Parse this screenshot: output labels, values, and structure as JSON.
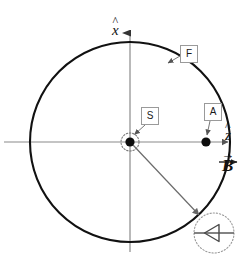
{
  "figure": {
    "type": "vector-diagram",
    "background_color": "#ffffff",
    "stroke_color": "#111111",
    "thin_stroke_color": "#888888",
    "dotted_stroke_color": "#9a9a9a",
    "box_border_color": "#9a9a9a",
    "width": 249,
    "height": 264
  },
  "axes": {
    "vertical": {
      "name": "x-axis",
      "label": "x",
      "accent": "hat",
      "accent_glyph": "^",
      "x": 130,
      "y_top": 30,
      "y_bottom": 252,
      "arrow_at": "top"
    },
    "horizontal": {
      "name": "z-axis",
      "label": "z",
      "accent": "hat",
      "accent_glyph": "^",
      "y": 142,
      "x_left": 4,
      "x_right": 230,
      "arrow_at": "right"
    }
  },
  "field_vector": {
    "name": "magnetic-field-vector",
    "label": "B",
    "accent": "arrow",
    "accent_glyph": "→",
    "direction": "+z",
    "arrow_x_start": 218,
    "arrow_x_end": 238,
    "arrow_y": 152
  },
  "main_circle": {
    "name": "outer-boundary-circle",
    "center_x": 130,
    "center_y": 142,
    "radius": 100,
    "stroke_width": 2
  },
  "points": [
    {
      "id": "S",
      "label": "S",
      "name": "source-point",
      "x": 130,
      "y": 142,
      "dot_radius": 4.5,
      "halo_radius": 9,
      "halo_style": "dotted"
    },
    {
      "id": "A",
      "label": "A",
      "name": "boundary-point",
      "x": 206,
      "y": 142,
      "dot_radius": 4.5,
      "halo_radius": 0,
      "halo_style": "none"
    }
  ],
  "callouts": [
    {
      "id": "F",
      "label": "F",
      "name": "callout-F",
      "box_x": 180,
      "box_y": 45,
      "leader_from_x": 180,
      "leader_from_y": 57,
      "leader_to_x": 167,
      "leader_to_y": 64,
      "target": "outer-boundary-circle"
    },
    {
      "id": "S",
      "label": "S",
      "name": "callout-S",
      "box_x": 141,
      "box_y": 107,
      "leader_from_x": 144,
      "leader_from_y": 125,
      "leader_to_x": 134,
      "leader_to_y": 134,
      "target": "source-point"
    },
    {
      "id": "A",
      "label": "A",
      "name": "callout-A",
      "box_x": 204,
      "box_y": 103,
      "leader_from_x": 208,
      "leader_from_y": 121,
      "leader_to_x": 207,
      "leader_to_y": 136,
      "target": "boundary-point"
    }
  ],
  "ray": {
    "name": "ray-from-source-to-detail",
    "from_x": 132,
    "from_y": 144,
    "to_x": 200,
    "to_y": 216,
    "arrow_at": "end",
    "stroke_color": "#666666"
  },
  "detail_inset": {
    "name": "detail-inset",
    "center_x": 214,
    "center_y": 233,
    "radius": 20,
    "circle_style": "dotted",
    "line_y": 233,
    "line_x_start": 194,
    "line_x_end": 234,
    "arrowhead": {
      "name": "arrowhead-glyph",
      "direction": "left",
      "tip_x": 205,
      "tip_y": 233,
      "back_x": 219,
      "half_height": 9,
      "filled": false
    }
  }
}
